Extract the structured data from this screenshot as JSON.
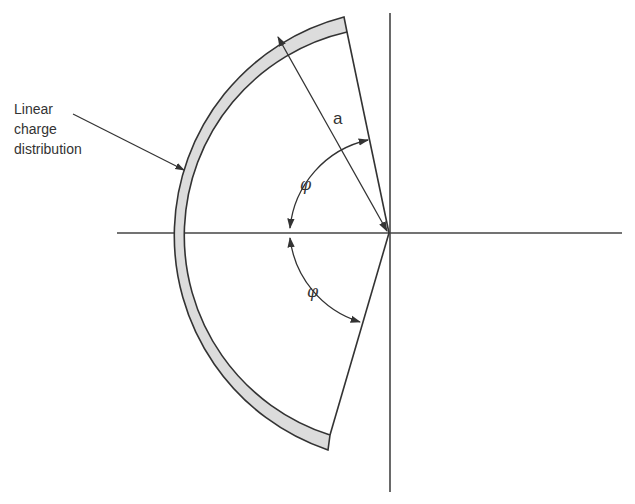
{
  "diagram": {
    "type": "geometry",
    "labels": {
      "charge_label_line1": "Linear",
      "charge_label_line2": "charge",
      "charge_label_line3": "distribution",
      "radius": "a",
      "angle_upper": "φ",
      "angle_lower": "φ"
    },
    "colors": {
      "stroke": "#333333",
      "band_fill": "#dcdcdc",
      "background": "#ffffff"
    }
  }
}
